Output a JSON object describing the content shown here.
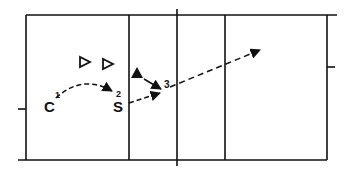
{
  "diagram": {
    "type": "volleyball-court-play",
    "colors": {
      "line": "#111111",
      "background": "#ffffff"
    },
    "players": [
      {
        "id": "C",
        "label": "C",
        "step": "1",
        "x": 50,
        "y": 106
      },
      {
        "id": "S",
        "label": "S",
        "step": "2",
        "x": 118,
        "y": 106
      }
    ],
    "step3_label": "3",
    "opponents_hollow": [
      {
        "x": 85,
        "y": 62,
        "shape": "hollow-triangle"
      },
      {
        "x": 108,
        "y": 64,
        "shape": "hollow-triangle"
      }
    ],
    "opponent_solid": {
      "x": 137,
      "y": 72,
      "shape": "solid-triangle"
    },
    "paths": [
      {
        "name": "pass-c-to-s",
        "style": "dashed-arrow"
      },
      {
        "name": "set-s-to-3",
        "style": "dashed-arrow"
      },
      {
        "name": "move-solid-to-3",
        "style": "solid-arrow"
      },
      {
        "name": "attack-3-to-deep",
        "style": "dashed-arrow"
      }
    ]
  }
}
